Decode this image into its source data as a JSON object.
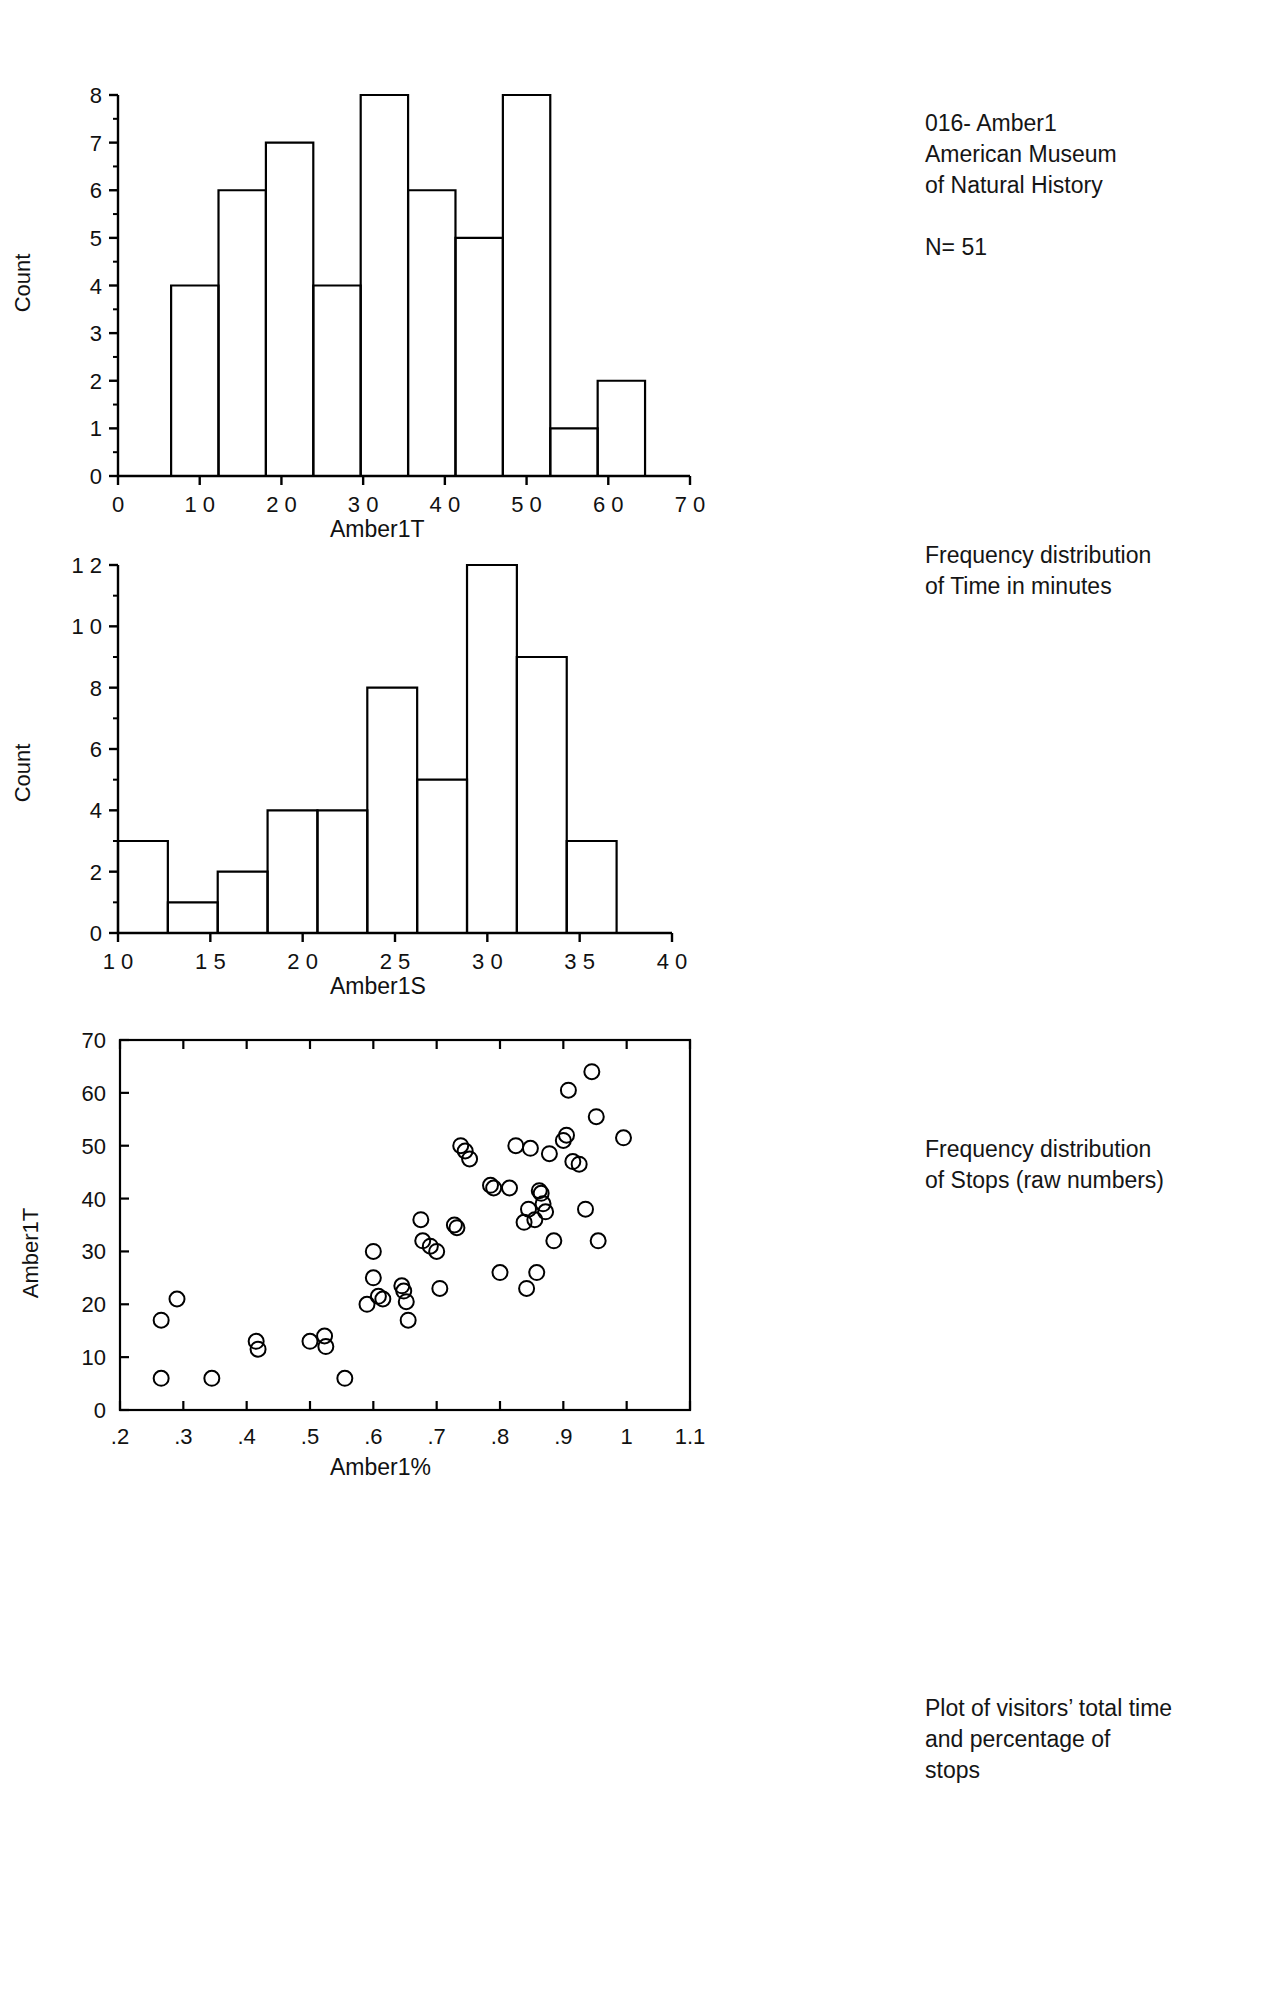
{
  "header": {
    "line1": "016- Amber1",
    "line2": "American Museum",
    "line3": "of Natural History",
    "n_label": "N= 51"
  },
  "captions": {
    "hist_time_line1": "Frequency distribution",
    "hist_time_line2": "of Time in minutes",
    "hist_stops_line1": "Frequency distribution",
    "hist_stops_line2": "of Stops (raw numbers)",
    "scatter_line1": "Plot of visitors’ total time",
    "scatter_line2": "and percentage of",
    "scatter_line3": "stops"
  },
  "chart_data": [
    {
      "id": "hist-amber1t",
      "type": "bar",
      "title": "",
      "xlabel": "Amber1T",
      "ylabel": "Count",
      "xlim": [
        0,
        70
      ],
      "ylim": [
        0,
        8
      ],
      "xticks": [
        0,
        10,
        20,
        30,
        40,
        50,
        60,
        70
      ],
      "xtick_labels": [
        "0",
        "1 0",
        "2 0",
        "3 0",
        "4 0",
        "5 0",
        "6 0",
        "7 0"
      ],
      "yticks": [
        0,
        1,
        2,
        3,
        4,
        5,
        6,
        7,
        8
      ],
      "ytick_labels": [
        "0",
        "1",
        "2",
        "3",
        "4",
        "5",
        "6",
        "7",
        "8"
      ],
      "y_minor_step": 0.5,
      "grid": false,
      "bin_edges": [
        6.5,
        12.3,
        18.1,
        23.9,
        29.7,
        35.5,
        41.3,
        47.1,
        52.9,
        58.7,
        64.5
      ],
      "categories": [
        "6.5-12.3",
        "12.3-18.1",
        "18.1-23.9",
        "23.9-29.7",
        "29.7-35.5",
        "35.5-41.3",
        "41.3-47.1",
        "47.1-52.9",
        "52.9-58.7",
        "58.7-64.5"
      ],
      "values": [
        4,
        6,
        7,
        4,
        8,
        6,
        5,
        8,
        1,
        2
      ]
    },
    {
      "id": "hist-amber1s",
      "type": "bar",
      "title": "",
      "xlabel": "Amber1S",
      "ylabel": "Count",
      "xlim": [
        10,
        40
      ],
      "ylim": [
        0,
        12
      ],
      "xticks": [
        10,
        15,
        20,
        25,
        30,
        35,
        40
      ],
      "xtick_labels": [
        "1 0",
        "1 5",
        "2 0",
        "2 5",
        "3 0",
        "3 5",
        "4 0"
      ],
      "yticks": [
        0,
        2,
        4,
        6,
        8,
        10,
        12
      ],
      "ytick_labels": [
        "0",
        "2",
        "4",
        "6",
        "8",
        "1 0",
        "1 2"
      ],
      "y_minor_step": 1,
      "grid": false,
      "bin_edges": [
        10.0,
        12.7,
        15.4,
        18.1,
        20.8,
        23.5,
        26.2,
        28.9,
        31.6,
        34.3,
        37.0,
        39.7
      ],
      "categories": [
        "10.0-12.7",
        "12.7-15.4",
        "15.4-18.1",
        "18.1-20.8",
        "20.8-23.5",
        "23.5-26.2",
        "26.2-28.9",
        "28.9-31.6",
        "31.6-34.3",
        "34.3-37.0",
        "37.0-39.7"
      ],
      "values": [
        3,
        1,
        2,
        4,
        4,
        8,
        5,
        12,
        9,
        3
      ]
    },
    {
      "id": "scatter-amber1",
      "type": "scatter",
      "title": "",
      "xlabel": "Amber1%",
      "ylabel": "Amber1T",
      "xlim": [
        0.2,
        1.1
      ],
      "ylim": [
        0,
        70
      ],
      "xticks": [
        0.2,
        0.3,
        0.4,
        0.5,
        0.6,
        0.7,
        0.8,
        0.9,
        1.0,
        1.1
      ],
      "xtick_labels": [
        ".2",
        ".3",
        ".4",
        ".5",
        ".6",
        ".7",
        ".8",
        ".9",
        "1",
        "1.1"
      ],
      "yticks": [
        0,
        10,
        20,
        30,
        40,
        50,
        60,
        70
      ],
      "ytick_labels": [
        "0",
        "10",
        "20",
        "30",
        "40",
        "50",
        "60",
        "70"
      ],
      "grid": false,
      "marker": "open-circle",
      "points": [
        [
          0.265,
          17
        ],
        [
          0.265,
          6
        ],
        [
          0.29,
          21
        ],
        [
          0.345,
          6
        ],
        [
          0.415,
          13
        ],
        [
          0.418,
          11.5
        ],
        [
          0.5,
          13
        ],
        [
          0.523,
          14
        ],
        [
          0.525,
          12
        ],
        [
          0.555,
          6
        ],
        [
          0.59,
          20
        ],
        [
          0.6,
          30
        ],
        [
          0.6,
          25
        ],
        [
          0.608,
          21.5
        ],
        [
          0.615,
          21
        ],
        [
          0.645,
          23.5
        ],
        [
          0.648,
          22.5
        ],
        [
          0.652,
          20.5
        ],
        [
          0.655,
          17
        ],
        [
          0.675,
          36
        ],
        [
          0.678,
          32
        ],
        [
          0.69,
          31
        ],
        [
          0.7,
          30
        ],
        [
          0.705,
          23
        ],
        [
          0.728,
          35
        ],
        [
          0.732,
          34.5
        ],
        [
          0.738,
          50
        ],
        [
          0.745,
          49
        ],
        [
          0.752,
          47.5
        ],
        [
          0.785,
          42.5
        ],
        [
          0.79,
          42
        ],
        [
          0.8,
          26
        ],
        [
          0.815,
          42
        ],
        [
          0.825,
          50
        ],
        [
          0.838,
          35.5
        ],
        [
          0.842,
          23
        ],
        [
          0.845,
          38
        ],
        [
          0.848,
          49.5
        ],
        [
          0.855,
          36
        ],
        [
          0.858,
          26
        ],
        [
          0.862,
          41.5
        ],
        [
          0.865,
          41
        ],
        [
          0.868,
          39
        ],
        [
          0.872,
          37.5
        ],
        [
          0.878,
          48.5
        ],
        [
          0.885,
          32
        ],
        [
          0.9,
          51
        ],
        [
          0.905,
          52
        ],
        [
          0.908,
          60.5
        ],
        [
          0.915,
          47
        ],
        [
          0.925,
          46.5
        ],
        [
          0.935,
          38
        ],
        [
          0.945,
          64
        ],
        [
          0.952,
          55.5
        ],
        [
          0.955,
          32
        ],
        [
          0.995,
          51.5
        ]
      ]
    }
  ]
}
